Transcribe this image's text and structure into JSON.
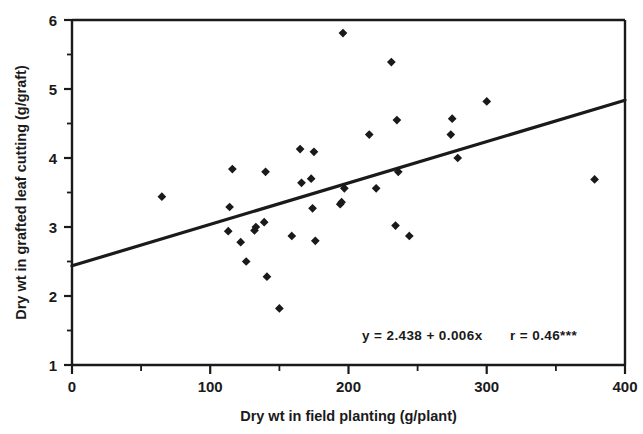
{
  "chart_data": {
    "type": "scatter",
    "title": "",
    "xlabel": "Dry wt in field planting (g/plant)",
    "ylabel": "Dry wt in grafted leaf cutting (g/graft)",
    "xlim": [
      0,
      400
    ],
    "ylim": [
      1,
      6
    ],
    "xticks": [
      0,
      100,
      200,
      300,
      400
    ],
    "xtick_labels": [
      "0",
      "100",
      "200",
      "300",
      "400"
    ],
    "xminor_ticks": [
      50,
      150,
      250,
      350
    ],
    "yticks": [
      1,
      2,
      3,
      4,
      5,
      6
    ],
    "ytick_labels": [
      "1",
      "2",
      "3",
      "4",
      "5",
      "6"
    ],
    "yminor_ticks": [
      1.5,
      2.5,
      3.5,
      4.5,
      5.5
    ],
    "grid": false,
    "legend": null,
    "marker": "diamond",
    "marker_color": "#1a1a1a",
    "points": [
      {
        "x": 65,
        "y": 3.44
      },
      {
        "x": 113,
        "y": 2.94
      },
      {
        "x": 114,
        "y": 3.29
      },
      {
        "x": 116,
        "y": 3.84
      },
      {
        "x": 122,
        "y": 2.78
      },
      {
        "x": 126,
        "y": 2.5
      },
      {
        "x": 132,
        "y": 2.95
      },
      {
        "x": 133,
        "y": 3.0
      },
      {
        "x": 139,
        "y": 3.07
      },
      {
        "x": 140,
        "y": 3.8
      },
      {
        "x": 141,
        "y": 2.28
      },
      {
        "x": 150,
        "y": 1.82
      },
      {
        "x": 159,
        "y": 2.87
      },
      {
        "x": 165,
        "y": 4.13
      },
      {
        "x": 166,
        "y": 3.64
      },
      {
        "x": 173,
        "y": 3.7
      },
      {
        "x": 174,
        "y": 3.27
      },
      {
        "x": 175,
        "y": 4.09
      },
      {
        "x": 176,
        "y": 2.8
      },
      {
        "x": 194,
        "y": 3.33
      },
      {
        "x": 195,
        "y": 3.36
      },
      {
        "x": 196,
        "y": 5.81
      },
      {
        "x": 197,
        "y": 3.56
      },
      {
        "x": 215,
        "y": 4.34
      },
      {
        "x": 220,
        "y": 3.56
      },
      {
        "x": 231,
        "y": 5.39
      },
      {
        "x": 234,
        "y": 3.02
      },
      {
        "x": 235,
        "y": 4.55
      },
      {
        "x": 236,
        "y": 3.8
      },
      {
        "x": 244,
        "y": 2.87
      },
      {
        "x": 274,
        "y": 4.34
      },
      {
        "x": 275,
        "y": 4.57
      },
      {
        "x": 279,
        "y": 4.0
      },
      {
        "x": 300,
        "y": 4.82
      },
      {
        "x": 378,
        "y": 3.69
      }
    ],
    "fit_line": {
      "intercept": 2.438,
      "slope": 0.006,
      "x_start": 0,
      "x_end": 400,
      "y_start": 2.438,
      "y_end": 4.838
    },
    "annotation": {
      "equation": "y  =  2.438  +  0.006x",
      "correlation": "r  =  0.46***",
      "full_text": "y = 2.438 + 0.006x    r = 0.46***"
    }
  }
}
